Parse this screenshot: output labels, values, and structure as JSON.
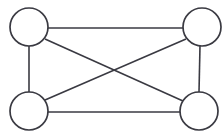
{
  "figure": {
    "background_color": "#ffffff",
    "stroke_color": "#3a3a42",
    "node_fill_color": "#ffffff",
    "width": 223,
    "height": 137
  },
  "chart_data": {
    "type": "diagram",
    "title": "",
    "subtitle": "",
    "xlabel": "",
    "ylabel": "",
    "grid": false,
    "legend": false,
    "graph_kind": "complete-graph-k4",
    "node_count": 4,
    "edge_count": 6,
    "node_radius": 19,
    "nodes": [
      {
        "id": "top-left",
        "label": "",
        "cx": 29,
        "cy": 27,
        "r": 19
      },
      {
        "id": "top-right",
        "label": "",
        "cx": 202,
        "cy": 27,
        "r": 19
      },
      {
        "id": "bottom-left",
        "label": "",
        "cx": 29,
        "cy": 111,
        "r": 19
      },
      {
        "id": "bottom-right",
        "label": "",
        "cx": 199,
        "cy": 111,
        "r": 19
      }
    ],
    "edges": [
      {
        "id": "edge-top",
        "from": "top-left",
        "to": "top-right",
        "kind": "horizontal",
        "x1": 48,
        "y1": 28,
        "x2": 183,
        "y2": 28
      },
      {
        "id": "edge-bottom",
        "from": "bottom-left",
        "to": "bottom-right",
        "kind": "horizontal",
        "x1": 48,
        "y1": 112,
        "x2": 180,
        "y2": 112
      },
      {
        "id": "edge-left",
        "from": "top-left",
        "to": "bottom-left",
        "kind": "vertical",
        "x1": 29,
        "y1": 46,
        "x2": 29,
        "y2": 92
      },
      {
        "id": "edge-right",
        "from": "top-right",
        "to": "bottom-right",
        "kind": "vertical",
        "x1": 200,
        "y1": 46,
        "x2": 199,
        "y2": 92
      },
      {
        "id": "edge-diagonal-down",
        "from": "top-left",
        "to": "bottom-right",
        "kind": "diagonal",
        "x1": 45,
        "y1": 39,
        "x2": 183,
        "y2": 101
      },
      {
        "id": "edge-diagonal-up",
        "from": "bottom-left",
        "to": "top-right",
        "kind": "diagonal",
        "x1": 45,
        "y1": 100,
        "x2": 186,
        "y2": 39
      }
    ],
    "crossing_point": {
      "x": 114,
      "y": 69
    }
  }
}
